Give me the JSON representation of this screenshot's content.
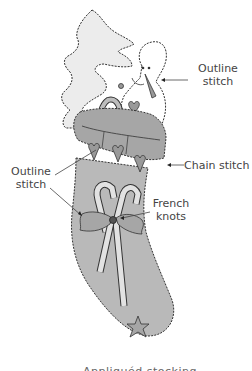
{
  "diagram": {
    "labels": {
      "outline_stitch_top": [
        "Outline",
        "stitch"
      ],
      "chain_stitch": "Chain stitch",
      "outline_stitch_left": [
        "Outline",
        "stitch"
      ],
      "french_knots": [
        "French",
        "knots"
      ]
    },
    "caption": "Appliquéd stocking with",
    "colors": {
      "stocking": "#b9b9b9",
      "cuff": "#a6a6a6",
      "tree": "#ececec",
      "snowman": "#ffffff",
      "outline": "#333333",
      "text": "#444444"
    }
  }
}
